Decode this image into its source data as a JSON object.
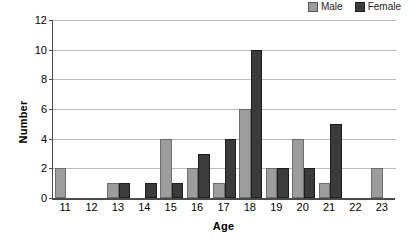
{
  "chart_data": {
    "type": "bar",
    "title": "",
    "subtitle": "",
    "xlabel": "Age",
    "ylabel": "Number",
    "categories": [
      "11",
      "12",
      "13",
      "14",
      "15",
      "16",
      "17",
      "18",
      "19",
      "20",
      "21",
      "22",
      "23"
    ],
    "series": [
      {
        "name": "Male",
        "color": "#9d9d9d",
        "values": [
          2,
          0,
          1,
          0,
          4,
          2,
          1,
          6,
          2,
          4,
          1,
          0,
          2
        ]
      },
      {
        "name": "Female",
        "color": "#3b3b3b",
        "values": [
          0,
          0,
          1,
          1,
          1,
          3,
          4,
          10,
          2,
          2,
          5,
          0,
          0
        ]
      }
    ],
    "ylim": [
      0,
      12
    ],
    "ytick_labels": [
      "0",
      "2",
      "4",
      "6",
      "8",
      "10",
      "12"
    ],
    "ytick_values": [
      0,
      2,
      4,
      6,
      8,
      10,
      12
    ],
    "grid": "horizontal",
    "legend_position": "top-right",
    "legend_entries": [
      "Male",
      "Female"
    ]
  }
}
